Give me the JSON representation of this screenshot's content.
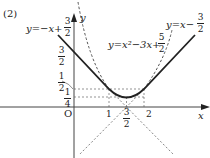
{
  "problem_label": "(2)",
  "axes": {
    "x_label": "x",
    "y_label": "y",
    "origin_label": "O"
  },
  "curves": [
    {
      "name": "line-left",
      "equation_prefix": "y=−x+",
      "frac": {
        "num": "3",
        "den": "2"
      },
      "style": "solid"
    },
    {
      "name": "parabola",
      "equation_prefix": "y=x²−3x+",
      "frac": {
        "num": "5",
        "den": "2"
      },
      "style": "dashed"
    },
    {
      "name": "line-right",
      "equation_prefix": "y=x−",
      "frac": {
        "num": "3",
        "den": "2"
      },
      "style": "solid"
    }
  ],
  "y_ticks": [
    {
      "num": "3",
      "den": "2",
      "value": 1.5
    },
    {
      "num": "1",
      "den": "2",
      "value": 0.5
    },
    {
      "num": "1",
      "den": "4",
      "value": 0.25
    }
  ],
  "x_ticks": [
    {
      "label": "1",
      "value": 1
    },
    {
      "num": "3",
      "den": "2",
      "value": 1.5
    },
    {
      "label": "2",
      "value": 2
    }
  ],
  "colors": {
    "ink": "#222222",
    "dashed": "#555555",
    "axis": "#444444"
  }
}
